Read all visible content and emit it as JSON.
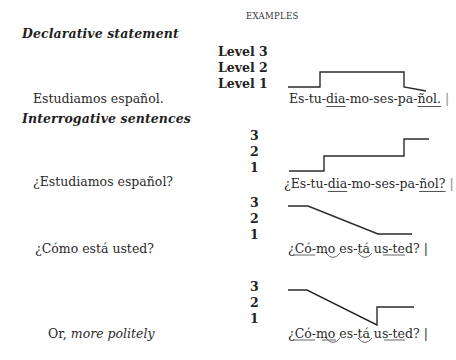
{
  "header": {
    "examples_label": "EXAMPLES"
  },
  "sections": {
    "declarative": {
      "heading": "Declarative statement",
      "levels": [
        "Level 3",
        "Level 2",
        "Level 1"
      ],
      "sentence": "Estudiamos español.",
      "syllables": {
        "pre": "Es-tu-",
        "stress1": "dia",
        "mid": "-mo-ses-pa-",
        "stress2": "ñol.",
        "end": " |"
      }
    },
    "interrogative": {
      "heading": "Interrogative sentences",
      "examples": [
        {
          "sentence": "¿Estudiamos español?",
          "levels": [
            "3",
            "2",
            "1"
          ],
          "syllables": {
            "pre": "¿Es-tu-",
            "stress1": "dia",
            "mid": "-mo-ses-pa-",
            "stress2": "ñol?",
            "end": " |"
          }
        },
        {
          "sentence": "¿Cómo está usted?",
          "levels": [
            "3",
            "2",
            "1"
          ],
          "syllables": "¿Có-mo es-tá us-ted? |"
        },
        {
          "sentence_prefix": "Or, ",
          "sentence_italic": "more politely",
          "levels": [
            "3",
            "2",
            "1"
          ],
          "syllables": "¿Có-mo es-tá us-ted? |"
        }
      ]
    }
  },
  "contours": {
    "stroke_color": "#2b2b2b",
    "declarative": [
      [
        288,
        87
      ],
      [
        320,
        87
      ],
      [
        320,
        72
      ],
      [
        404,
        72
      ],
      [
        404,
        87
      ],
      [
        426,
        91
      ]
    ],
    "question_yes_no": [
      [
        289,
        171
      ],
      [
        324,
        171
      ],
      [
        324,
        156
      ],
      [
        404,
        156
      ],
      [
        404,
        139
      ],
      [
        429,
        139
      ]
    ],
    "question_info": [
      [
        288,
        206
      ],
      [
        308,
        206
      ],
      [
        378,
        234
      ],
      [
        412,
        234
      ]
    ],
    "question_polite": [
      [
        288,
        290
      ],
      [
        307,
        290
      ],
      [
        377,
        325
      ],
      [
        377,
        307
      ],
      [
        414,
        307
      ]
    ]
  }
}
